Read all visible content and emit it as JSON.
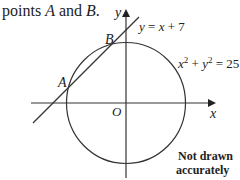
{
  "question_fragment": {
    "prefix": "points ",
    "point_a": "A",
    "and": " and ",
    "point_b": "B",
    "suffix": "."
  },
  "diagram": {
    "y_axis_label": "y",
    "x_axis_label": "x",
    "origin_label": "O",
    "line_label": "y = x + 7",
    "circle_label_base_x": "x",
    "circle_label_exp": "2",
    "circle_label_plus": " + y",
    "circle_label_exp2": "2",
    "circle_label_rhs": " = 25",
    "point_a_label": "A",
    "point_b_label": "B",
    "note_line1": "Not drawn",
    "note_line2": "accurately"
  }
}
